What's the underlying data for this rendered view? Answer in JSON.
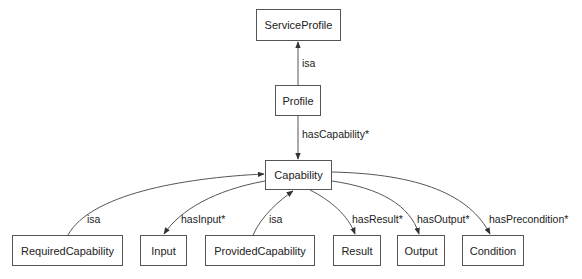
{
  "nodes": {
    "service_profile": {
      "label": "ServiceProfile"
    },
    "profile": {
      "label": "Profile"
    },
    "capability": {
      "label": "Capability"
    },
    "required_capability": {
      "label": "RequiredCapability"
    },
    "input": {
      "label": "Input"
    },
    "provided_capability": {
      "label": "ProvidedCapability"
    },
    "result": {
      "label": "Result"
    },
    "output": {
      "label": "Output"
    },
    "condition": {
      "label": "Condition"
    }
  },
  "edges": {
    "profile_isa_service_profile": {
      "label": "isa",
      "from": "Profile",
      "to": "ServiceProfile"
    },
    "profile_has_capability": {
      "label": "hasCapability*",
      "from": "Profile",
      "to": "Capability"
    },
    "required_isa_capability": {
      "label": "isa",
      "from": "RequiredCapability",
      "to": "Capability"
    },
    "capability_has_input": {
      "label": "hasInput*",
      "from": "Capability",
      "to": "Input"
    },
    "provided_isa_capability": {
      "label": "isa",
      "from": "ProvidedCapability",
      "to": "Capability"
    },
    "capability_has_result": {
      "label": "hasResult*",
      "from": "Capability",
      "to": "Result"
    },
    "capability_has_output": {
      "label": "hasOutput*",
      "from": "Capability",
      "to": "Output"
    },
    "capability_has_precondition": {
      "label": "hasPrecondition*",
      "from": "Capability",
      "to": "Condition"
    }
  },
  "colors": {
    "stroke": "#555555",
    "text": "#222222",
    "background": "#ffffff"
  }
}
